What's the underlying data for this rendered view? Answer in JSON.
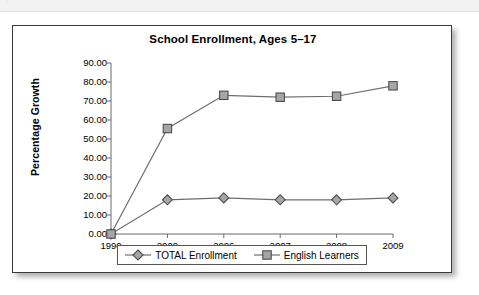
{
  "figure": {
    "title": "School Enrollment, Ages 5–17",
    "ghost_strip_text": "·"
  },
  "chart_data": {
    "type": "line",
    "title": "School Enrollment, Ages 5–17",
    "xlabel": "",
    "ylabel": "Percentage Growth",
    "categories": [
      "1990",
      "2000",
      "2006",
      "2007",
      "2008",
      "2009"
    ],
    "series": [
      {
        "name": "TOTAL Enrollment",
        "marker": "diamond",
        "color": "#808080",
        "values": [
          0.0,
          18.0,
          19.0,
          18.0,
          18.0,
          19.0
        ]
      },
      {
        "name": "English Learners",
        "marker": "square",
        "color": "#808080",
        "values": [
          0.0,
          55.5,
          73.0,
          72.0,
          72.5,
          78.0
        ]
      }
    ],
    "ylim": [
      0,
      90
    ],
    "y_ticks": [
      0,
      10,
      20,
      30,
      40,
      50,
      60,
      70,
      80,
      90
    ],
    "y_tick_labels": [
      "0.00",
      "10.00",
      "20.00",
      "30.00",
      "40.00",
      "50.00",
      "60.00",
      "70.00",
      "80.00",
      "90.00"
    ],
    "grid": false,
    "legend_position": "bottom"
  },
  "legend": {
    "entries": [
      {
        "label": "TOTAL Enrollment",
        "marker": "diamond"
      },
      {
        "label": "English Learners",
        "marker": "square"
      }
    ]
  }
}
